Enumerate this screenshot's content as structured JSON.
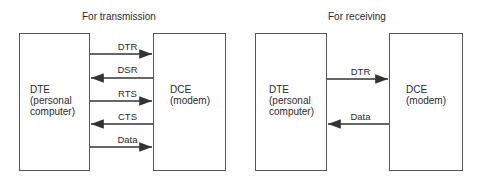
{
  "transmission": {
    "title": "For transmission",
    "dte": {
      "name": "DTE",
      "sub": "(personal\ncomputer)"
    },
    "dce": {
      "name": "DCE",
      "sub": "(modem)"
    },
    "signals": [
      {
        "label": "DTR",
        "direction": "to-dce"
      },
      {
        "label": "DSR",
        "direction": "to-dte"
      },
      {
        "label": "RTS",
        "direction": "to-dce"
      },
      {
        "label": "CTS",
        "direction": "to-dte"
      },
      {
        "label": "Data",
        "direction": "to-dce"
      }
    ]
  },
  "receiving": {
    "title": "For receiving",
    "dte": {
      "name": "DTE",
      "sub": "(personal\ncomputer)"
    },
    "dce": {
      "name": "DCE",
      "sub": "(modem)"
    },
    "signals": [
      {
        "label": "DTR",
        "direction": "to-dce"
      },
      {
        "label": "Data",
        "direction": "to-dte"
      }
    ]
  }
}
